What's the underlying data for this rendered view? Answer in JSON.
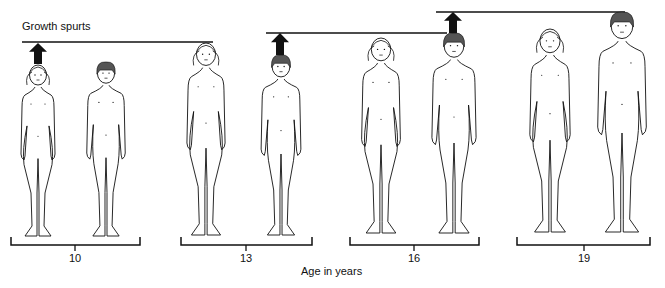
{
  "title": "Growth spurts",
  "axis_title": "Age in years",
  "colors": {
    "ink": "#111111",
    "hair_dark": "#555555",
    "background": "#ffffff"
  },
  "groups": [
    {
      "age": "10",
      "bracket": [
        11,
        140
      ],
      "tick": 75,
      "figures": [
        {
          "sex": "female",
          "cx": 38,
          "top": 64,
          "feet": 236,
          "growth_spurt": true
        },
        {
          "sex": "male",
          "cx": 106,
          "top": 62,
          "feet": 236,
          "growth_spurt": false
        }
      ]
    },
    {
      "age": "13",
      "bracket": [
        181,
        312
      ],
      "tick": 246,
      "figures": [
        {
          "sex": "female",
          "cx": 206,
          "top": 42,
          "feet": 235,
          "growth_spurt": false
        },
        {
          "sex": "male",
          "cx": 281,
          "top": 55,
          "feet": 235,
          "growth_spurt": true
        }
      ]
    },
    {
      "age": "16",
      "bracket": [
        350,
        479
      ],
      "tick": 414,
      "figures": [
        {
          "sex": "female",
          "cx": 381,
          "top": 37,
          "feet": 233,
          "growth_spurt": false
        },
        {
          "sex": "male",
          "cx": 454,
          "top": 33,
          "feet": 233,
          "growth_spurt": true
        }
      ]
    },
    {
      "age": "19",
      "bracket": [
        517,
        650
      ],
      "tick": 584,
      "figures": [
        {
          "sex": "female",
          "cx": 550,
          "top": 28,
          "feet": 232,
          "growth_spurt": false
        },
        {
          "sex": "male",
          "cx": 622,
          "top": 12,
          "feet": 232,
          "growth_spurt": false
        }
      ]
    }
  ],
  "height_lines": [
    {
      "x1": 22,
      "x2": 213,
      "y": 42
    },
    {
      "x1": 266,
      "x2": 447,
      "y": 33
    },
    {
      "x1": 436,
      "x2": 625,
      "y": 12
    }
  ],
  "arrows": [
    {
      "cx": 38,
      "base": 64,
      "tip": 43
    },
    {
      "cx": 280,
      "base": 55,
      "tip": 33
    },
    {
      "cx": 453,
      "base": 33,
      "tip": 12
    }
  ]
}
